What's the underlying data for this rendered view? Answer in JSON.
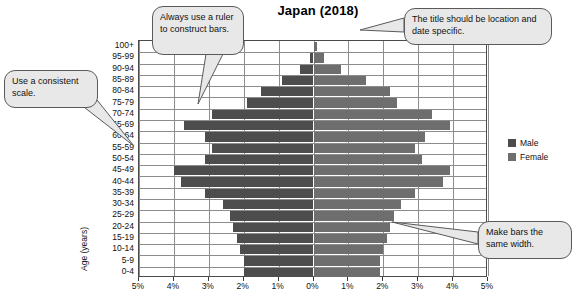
{
  "chart_data": {
    "type": "bar",
    "subtype": "population-pyramid",
    "title": "Japan (2018)",
    "xlabel": "",
    "ylabel": "Age (years)",
    "xlim": [
      -5,
      5
    ],
    "xticks": [
      "5%",
      "4%",
      "3%",
      "2%",
      "1%",
      "0%",
      "1%",
      "2%",
      "3%",
      "4%",
      "5%"
    ],
    "xtick_values": [
      -5,
      -4,
      -3,
      -2,
      -1,
      0,
      1,
      2,
      3,
      4,
      5
    ],
    "grid": true,
    "legend_position": "right",
    "categories": [
      "100+",
      "95-99",
      "90-94",
      "85-89",
      "80-84",
      "75-79",
      "70-74",
      "65-69",
      "60-64",
      "55-59",
      "50-54",
      "45-49",
      "40-44",
      "35-39",
      "30-34",
      "25-29",
      "20-24",
      "15-19",
      "10-14",
      "5-9",
      "0-4"
    ],
    "series": [
      {
        "name": "Male",
        "color": "#4d4d4d",
        "values": [
          0.0,
          0.1,
          0.4,
          0.9,
          1.5,
          1.9,
          2.9,
          3.7,
          3.1,
          2.9,
          3.1,
          4.0,
          3.8,
          3.1,
          2.6,
          2.4,
          2.3,
          2.2,
          2.1,
          2.0,
          2.0
        ]
      },
      {
        "name": "Female",
        "color": "#6e6e6e",
        "values": [
          0.1,
          0.3,
          0.8,
          1.5,
          2.2,
          2.4,
          3.4,
          3.9,
          3.2,
          2.9,
          3.1,
          3.9,
          3.7,
          2.9,
          2.5,
          2.3,
          2.2,
          2.1,
          2.0,
          1.9,
          1.9
        ]
      }
    ]
  },
  "chart": {
    "title": "Japan (2018)",
    "y_axis_title": "Age (years)",
    "age_labels": [
      "100+",
      "95-99",
      "90-94",
      "85-89",
      "80-84",
      "75-79",
      "70-74",
      "65-69",
      "60-64",
      "55-59",
      "50-54",
      "45-49",
      "40-44",
      "35-39",
      "30-34",
      "25-29",
      "20-24",
      "15-19",
      "10-14",
      "5-9",
      "0-4"
    ],
    "x_labels": [
      "5%",
      "4%",
      "3%",
      "2%",
      "1%",
      "0%",
      "1%",
      "2%",
      "3%",
      "4%",
      "5%"
    ]
  },
  "legend": {
    "items": [
      {
        "label": "Male",
        "color": "#4d4d4d"
      },
      {
        "label": "Female",
        "color": "#6e6e6e"
      }
    ]
  },
  "callouts": [
    {
      "id": "scale",
      "text": "Use a consistent scale."
    },
    {
      "id": "ruler",
      "text": "Always use a ruler to construct bars."
    },
    {
      "id": "title",
      "text": "The title should be location and date specific."
    },
    {
      "id": "width",
      "text": "Make bars the same width."
    }
  ]
}
